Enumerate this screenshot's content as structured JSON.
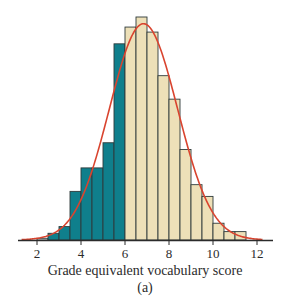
{
  "chart_data": {
    "type": "bar",
    "subtype": "histogram",
    "title": "",
    "xlabel": "Grade equivalent vocabulary score",
    "ylabel": "",
    "panel_label": "(a)",
    "xlim": [
      1.2,
      12.7
    ],
    "x_ticks": [
      2,
      4,
      6,
      8,
      10,
      12
    ],
    "bin_width": 0.5,
    "bins": [
      {
        "from": 2.0,
        "to": 2.5,
        "value": 0.1,
        "shaded": false
      },
      {
        "from": 2.5,
        "to": 3.0,
        "value": 0.4,
        "shaded": true
      },
      {
        "from": 3.0,
        "to": 3.5,
        "value": 0.8,
        "shaded": true
      },
      {
        "from": 3.5,
        "to": 4.0,
        "value": 2.9,
        "shaded": true
      },
      {
        "from": 4.0,
        "to": 4.5,
        "value": 4.3,
        "shaded": true
      },
      {
        "from": 4.5,
        "to": 5.0,
        "value": 4.3,
        "shaded": true
      },
      {
        "from": 5.0,
        "to": 5.5,
        "value": 5.8,
        "shaded": true
      },
      {
        "from": 5.5,
        "to": 6.0,
        "value": 11.7,
        "shaded": true
      },
      {
        "from": 6.0,
        "to": 6.5,
        "value": 12.7,
        "shaded": false
      },
      {
        "from": 6.5,
        "to": 7.0,
        "value": 13.3,
        "shaded": false
      },
      {
        "from": 7.0,
        "to": 7.5,
        "value": 12.4,
        "shaded": false
      },
      {
        "from": 7.5,
        "to": 8.0,
        "value": 9.8,
        "shaded": false
      },
      {
        "from": 8.0,
        "to": 8.5,
        "value": 8.4,
        "shaded": false
      },
      {
        "from": 8.5,
        "to": 9.0,
        "value": 5.4,
        "shaded": false
      },
      {
        "from": 9.0,
        "to": 9.5,
        "value": 3.3,
        "shaded": false
      },
      {
        "from": 9.5,
        "to": 10.0,
        "value": 2.6,
        "shaded": false
      },
      {
        "from": 10.0,
        "to": 10.5,
        "value": 1.0,
        "shaded": false
      },
      {
        "from": 10.5,
        "to": 11.0,
        "value": 0.5,
        "shaded": false
      },
      {
        "from": 11.0,
        "to": 11.5,
        "value": 0.5,
        "shaded": false
      }
    ],
    "shaded_region": {
      "below": 6.0,
      "description": "scores less than 6 shaded"
    },
    "overlay_curve": {
      "type": "normal_density",
      "mean": 6.84,
      "sd": 1.55,
      "peak_value": 12.9
    },
    "grid": false,
    "legend": null,
    "colors": {
      "shaded_bar": "#0f7f8c",
      "unshaded_bar": "#ede0b8",
      "first_bar": "#ffffff",
      "bar_outline": "#2f3b3b",
      "curve": "#d9442f",
      "axis": "#2b2b2b"
    }
  }
}
